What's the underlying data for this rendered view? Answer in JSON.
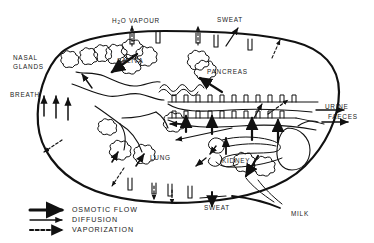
{
  "diagram": {
    "type": "schematic",
    "background_color": "#ffffff",
    "ink_color": "#111111"
  },
  "labels": {
    "h2o_vapour": "H2O VAPOUR",
    "h2o_vapour_prefix": "H",
    "h2o_vapour_sub": "2",
    "h2o_vapour_suffix": "O VAPOUR",
    "sweat_top": "SWEAT",
    "nasal_glands_line1": "NASAL",
    "nasal_glands_line2": "GLANDS",
    "breath": "BREATH",
    "saliva": "SALIVA",
    "pancreas": "PANCREAS",
    "urine": "URINE",
    "faeces": "FAECES",
    "lung": "LUNG",
    "kidney": "KIDNEY",
    "sweat_bottom": "SWEAT",
    "milk": "MILK"
  },
  "legend": {
    "items": [
      {
        "label": "OSMOTIC FLOW",
        "arrow_style": "thick-solid"
      },
      {
        "label": "DIFFUSION",
        "arrow_style": "thin-solid"
      },
      {
        "label": "VAPORIZATION",
        "arrow_style": "dashed"
      }
    ]
  },
  "structures": [
    {
      "name": "body-outline",
      "shape": "oval"
    },
    {
      "name": "skin-pores-top",
      "count": 5
    },
    {
      "name": "skin-pores-bottom",
      "count": 4
    },
    {
      "name": "nasal-gland-cluster",
      "shape": "lobed"
    },
    {
      "name": "salivary-gland-cluster",
      "shape": "lobed"
    },
    {
      "name": "pancreas-cluster",
      "shape": "lobed"
    },
    {
      "name": "lung-alveoli",
      "count": 4
    },
    {
      "name": "gut-villi",
      "shape": "comb"
    },
    {
      "name": "kidney",
      "shape": "bean-tubule"
    },
    {
      "name": "bladder",
      "shape": "teardrop"
    },
    {
      "name": "mammary-gland",
      "shape": "lobed"
    }
  ]
}
